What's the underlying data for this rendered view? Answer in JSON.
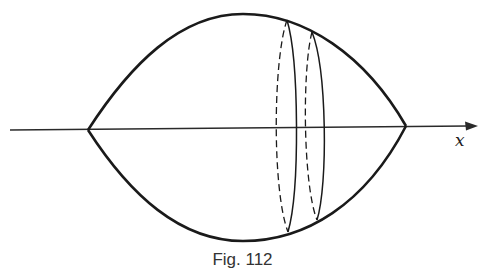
{
  "figure": {
    "caption": "Fig. 112",
    "axis_label": "x",
    "colors": {
      "stroke": "#1a1a1a",
      "background": "#ffffff"
    },
    "shape": {
      "left_vertex": [
        88,
        130
      ],
      "right_vertex": [
        406,
        126
      ],
      "top_apex": [
        243,
        14
      ],
      "bottom_apex": [
        243,
        241
      ]
    },
    "cross_sections": [
      {
        "name": "section-1",
        "top": [
          287,
          20
        ],
        "bottom": [
          288,
          232
        ],
        "hidden_x": 276,
        "visible_x": 297
      },
      {
        "name": "section-2",
        "top": [
          312,
          32
        ],
        "bottom": [
          317,
          220
        ],
        "hidden_x": 306,
        "visible_x": 325
      }
    ]
  }
}
